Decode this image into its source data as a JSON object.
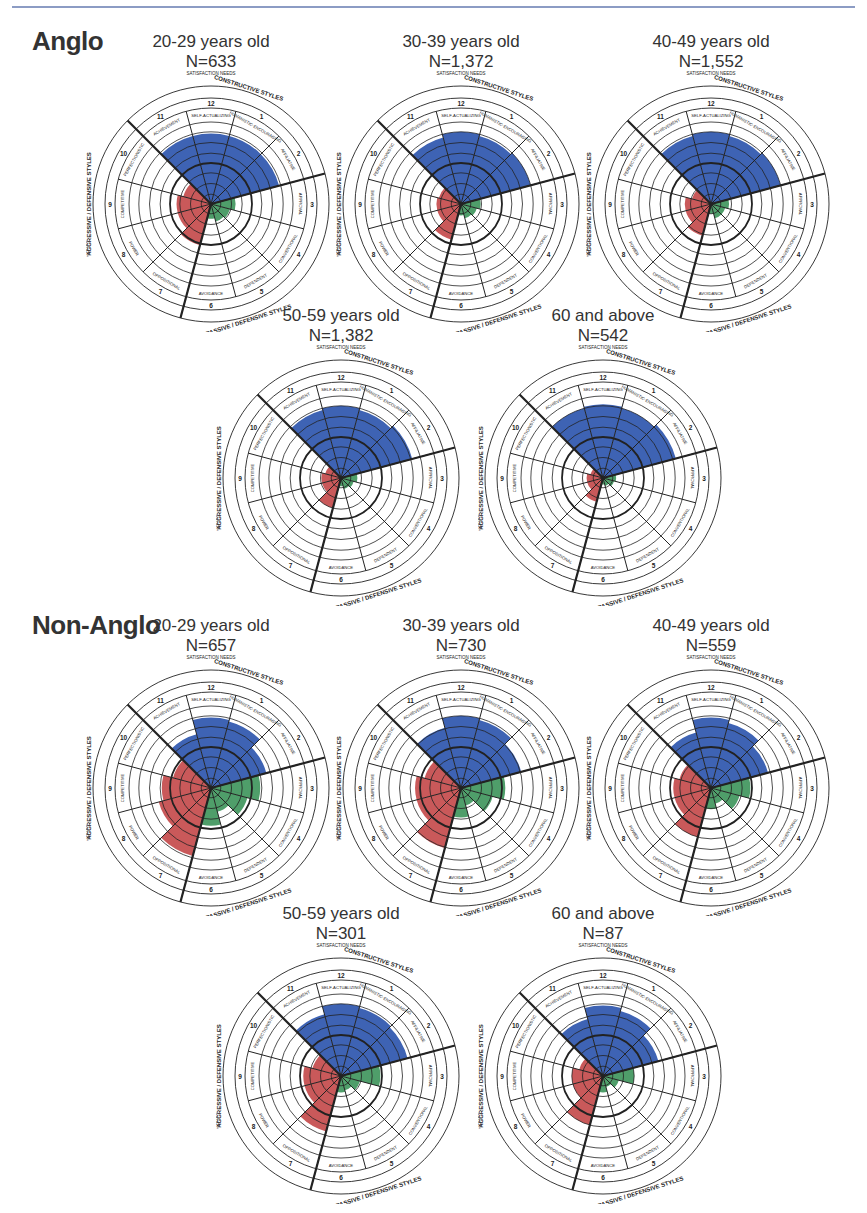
{
  "groups": [
    {
      "label": "Anglo",
      "panels": [
        {
          "age": "20-29 years old",
          "n": "N=633"
        },
        {
          "age": "30-39 years old",
          "n": "N=1,372"
        },
        {
          "age": "40-49 years old",
          "n": "N=1,552"
        },
        {
          "age": "50-59 years old",
          "n": "N=1,382"
        },
        {
          "age": "60 and above",
          "n": "N=542"
        }
      ]
    },
    {
      "label": "Non-Anglo",
      "panels": [
        {
          "age": "20-29 years old",
          "n": "N=657"
        },
        {
          "age": "30-39 years old",
          "n": "N=730"
        },
        {
          "age": "40-49 years old",
          "n": "N=559"
        },
        {
          "age": "50-59 years old",
          "n": "N=301"
        },
        {
          "age": "60 and above",
          "n": "N=87"
        }
      ]
    }
  ],
  "circumplex_labels": {
    "satisfaction_needs": "SATISFACTION NEEDS",
    "security_needs": "SECURITY NEEDS",
    "constructive_styles": "CONSTRUCTIVE STYLES",
    "passive_defensive_styles": "PASSIVE / DEFENSIVE STYLES",
    "aggressive_defensive_styles": "AGGRESSIVE / DEFENSIVE STYLES",
    "task_orientation": "TASK ORIENTATION",
    "people_orientation": "PEOPLE ORIENTATION",
    "segments": [
      {
        "num": "1",
        "name": "HUMANISTIC-ENCOURAGING"
      },
      {
        "num": "2",
        "name": "AFFILIATIVE"
      },
      {
        "num": "3",
        "name": "APPROVAL"
      },
      {
        "num": "4",
        "name": "CONVENTIONAL"
      },
      {
        "num": "5",
        "name": "DEPENDENT"
      },
      {
        "num": "6",
        "name": "AVOIDANCE"
      },
      {
        "num": "7",
        "name": "OPPOSITIONAL"
      },
      {
        "num": "8",
        "name": "POWER"
      },
      {
        "num": "9",
        "name": "COMPETITIVE"
      },
      {
        "num": "10",
        "name": "PERFECTIONISTIC"
      },
      {
        "num": "11",
        "name": "ACHIEVEMENT"
      },
      {
        "num": "12",
        "name": "SELF-ACTUALIZING"
      }
    ]
  },
  "colors": {
    "constructive": "#3e63b4",
    "passive": "#4f9e6a",
    "aggressive": "#c9595a",
    "line": "#222222",
    "topline": "#8c9cc4"
  },
  "chart_data": [
    {
      "type": "circumplex",
      "title": "Anglo 20-29 years old",
      "n": 633,
      "segments": [
        "1",
        "2",
        "3",
        "4",
        "5",
        "6",
        "7",
        "8",
        "9",
        "10",
        "11",
        "12"
      ],
      "values": [
        0.86,
        0.86,
        0.3,
        0.24,
        0.22,
        0.18,
        0.52,
        0.42,
        0.42,
        0.35,
        0.86,
        0.86
      ]
    },
    {
      "type": "circumplex",
      "title": "Anglo 30-39 years old",
      "n": 1372,
      "segments": [
        "1",
        "2",
        "3",
        "4",
        "5",
        "6",
        "7",
        "8",
        "9",
        "10",
        "11",
        "12"
      ],
      "values": [
        0.86,
        0.88,
        0.24,
        0.2,
        0.18,
        0.14,
        0.45,
        0.3,
        0.3,
        0.28,
        0.84,
        0.88
      ]
    },
    {
      "type": "circumplex",
      "title": "Anglo 40-49 years old",
      "n": 1552,
      "segments": [
        "1",
        "2",
        "3",
        "4",
        "5",
        "6",
        "7",
        "8",
        "9",
        "10",
        "11",
        "12"
      ],
      "values": [
        0.86,
        0.88,
        0.22,
        0.18,
        0.18,
        0.12,
        0.4,
        0.32,
        0.32,
        0.24,
        0.86,
        0.88
      ]
    },
    {
      "type": "circumplex",
      "title": "Anglo 50-59 years old",
      "n": 1382,
      "segments": [
        "1",
        "2",
        "3",
        "4",
        "5",
        "6",
        "7",
        "8",
        "9",
        "10",
        "11",
        "12"
      ],
      "values": [
        0.86,
        0.9,
        0.2,
        0.16,
        0.14,
        0.1,
        0.38,
        0.24,
        0.24,
        0.2,
        0.86,
        0.88
      ]
    },
    {
      "type": "circumplex",
      "title": "Anglo 60 and above",
      "n": 542,
      "segments": [
        "1",
        "2",
        "3",
        "4",
        "5",
        "6",
        "7",
        "8",
        "9",
        "10",
        "11",
        "12"
      ],
      "values": [
        0.88,
        0.92,
        0.16,
        0.14,
        0.1,
        0.08,
        0.3,
        0.2,
        0.2,
        0.16,
        0.88,
        0.9
      ]
    },
    {
      "type": "circumplex",
      "title": "Non-Anglo 20-29 years old",
      "n": 657,
      "segments": [
        "1",
        "2",
        "3",
        "4",
        "5",
        "6",
        "7",
        "8",
        "9",
        "10",
        "11",
        "12"
      ],
      "values": [
        0.84,
        0.7,
        0.6,
        0.46,
        0.3,
        0.46,
        0.86,
        0.66,
        0.6,
        0.48,
        0.68,
        0.86
      ]
    },
    {
      "type": "circumplex",
      "title": "Non-Anglo 30-39 years old",
      "n": 730,
      "segments": [
        "1",
        "2",
        "3",
        "4",
        "5",
        "6",
        "7",
        "8",
        "9",
        "10",
        "11",
        "12"
      ],
      "values": [
        0.86,
        0.76,
        0.54,
        0.4,
        0.22,
        0.36,
        0.76,
        0.56,
        0.56,
        0.46,
        0.76,
        0.88
      ]
    },
    {
      "type": "circumplex",
      "title": "Non-Anglo 40-49 years old",
      "n": 559,
      "segments": [
        "1",
        "2",
        "3",
        "4",
        "5",
        "6",
        "7",
        "8",
        "9",
        "10",
        "11",
        "12"
      ],
      "values": [
        0.82,
        0.72,
        0.48,
        0.36,
        0.2,
        0.26,
        0.62,
        0.46,
        0.46,
        0.4,
        0.7,
        0.86
      ]
    },
    {
      "type": "circumplex",
      "title": "Non-Anglo 50-59 years old",
      "n": 301,
      "segments": [
        "1",
        "2",
        "3",
        "4",
        "5",
        "6",
        "7",
        "8",
        "9",
        "10",
        "11",
        "12"
      ],
      "values": [
        0.86,
        0.84,
        0.48,
        0.24,
        0.18,
        0.2,
        0.7,
        0.46,
        0.46,
        0.36,
        0.78,
        0.88
      ]
    },
    {
      "type": "circumplex",
      "title": "Non-Anglo 60 and above",
      "n": 87,
      "segments": [
        "1",
        "2",
        "3",
        "4",
        "5",
        "6",
        "7",
        "8",
        "9",
        "10",
        "11",
        "12"
      ],
      "values": [
        0.82,
        0.7,
        0.38,
        0.2,
        0.14,
        0.2,
        0.62,
        0.38,
        0.38,
        0.3,
        0.72,
        0.86
      ]
    }
  ]
}
